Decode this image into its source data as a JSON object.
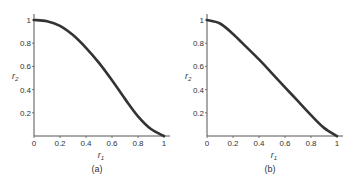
{
  "chart_data": [
    {
      "type": "line",
      "title": "",
      "caption": "(a)",
      "xlabel": "r1",
      "ylabel": "r2",
      "xlim": [
        0,
        1
      ],
      "ylim": [
        0,
        1.03
      ],
      "xticks": [
        "0",
        "0.2",
        "0.4",
        "0.6",
        "0.8",
        "1"
      ],
      "yticks": [
        "0.2",
        "0.4",
        "0.6",
        "0.8",
        "1"
      ],
      "grid": false,
      "series": [
        {
          "name": "curve-a",
          "x": [
            0,
            0.1,
            0.2,
            0.3,
            0.4,
            0.5,
            0.6,
            0.7,
            0.8,
            0.9,
            1.0
          ],
          "y": [
            1.0,
            0.99,
            0.95,
            0.87,
            0.76,
            0.63,
            0.48,
            0.32,
            0.17,
            0.06,
            0.0
          ]
        }
      ]
    },
    {
      "type": "line",
      "title": "",
      "caption": "(b)",
      "xlabel": "r1",
      "ylabel": "r2",
      "xlim": [
        0,
        1
      ],
      "ylim": [
        0,
        1.03
      ],
      "xticks": [
        "0",
        "0.2",
        "0.4",
        "0.6",
        "0.8",
        "1"
      ],
      "yticks": [
        "0.2",
        "0.4",
        "0.6",
        "0.8",
        "1"
      ],
      "grid": false,
      "series": [
        {
          "name": "curve-b",
          "x": [
            0,
            0.1,
            0.2,
            0.3,
            0.4,
            0.5,
            0.6,
            0.7,
            0.8,
            0.9,
            1.0
          ],
          "y": [
            1.0,
            0.97,
            0.88,
            0.77,
            0.66,
            0.54,
            0.42,
            0.3,
            0.18,
            0.07,
            0.0
          ]
        }
      ]
    }
  ],
  "panels": [
    {
      "caption": "(a)",
      "xlabel": "r",
      "xlabel_sub": "1",
      "ylabel": "r",
      "ylabel_sub": "2"
    },
    {
      "caption": "(b)",
      "xlabel": "r",
      "xlabel_sub": "1",
      "ylabel": "r",
      "ylabel_sub": "2"
    }
  ]
}
